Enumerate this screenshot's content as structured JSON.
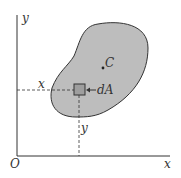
{
  "diagram": {
    "axes": {
      "origin_label": "O",
      "x_axis_label": "x",
      "y_axis_label": "y"
    },
    "region": {
      "fill_color": "#bdbdbd",
      "stroke_color": "#333333",
      "centroid_label": "C"
    },
    "element": {
      "label": "dA",
      "fill_color": "#9e9e9e"
    },
    "guides": {
      "x_distance_label": "x",
      "y_distance_label": "y"
    }
  }
}
